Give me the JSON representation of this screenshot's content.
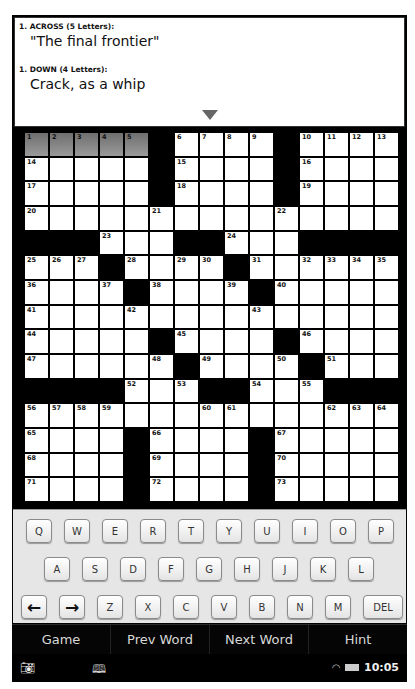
{
  "clues": {
    "across": {
      "heading": "1. ACROSS (5 Letters):",
      "text": "\"The final frontier\""
    },
    "down": {
      "heading": "1. DOWN (4 Letters):",
      "text": "Crack, as a whip"
    },
    "expand_icon": "triangle-down"
  },
  "grid": {
    "size": 15,
    "highlight_color": "#808080",
    "rows": [
      "....._...._....",
      "....._...._....",
      "....._...._....",
      "...............",
      "___...__...____",
      "..._...._......",
      "...._...._.....",
      "...............",
      "....._...._....",
      "......_...._...",
      "____...__...___",
      "...............",
      "...._...._.....",
      "...._...._.....",
      "...._...._....."
    ],
    "numbers": [
      [
        0,
        0,
        "1"
      ],
      [
        0,
        1,
        "2"
      ],
      [
        0,
        2,
        "3"
      ],
      [
        0,
        3,
        "4"
      ],
      [
        0,
        4,
        "5"
      ],
      [
        0,
        6,
        "6"
      ],
      [
        0,
        7,
        "7"
      ],
      [
        0,
        8,
        "8"
      ],
      [
        0,
        9,
        "9"
      ],
      [
        0,
        11,
        "10"
      ],
      [
        0,
        12,
        "11"
      ],
      [
        0,
        13,
        "12"
      ],
      [
        0,
        14,
        "13"
      ],
      [
        1,
        0,
        "14"
      ],
      [
        1,
        6,
        "15"
      ],
      [
        1,
        11,
        "16"
      ],
      [
        2,
        0,
        "17"
      ],
      [
        2,
        6,
        "18"
      ],
      [
        2,
        11,
        "19"
      ],
      [
        3,
        0,
        "20"
      ],
      [
        3,
        5,
        "21"
      ],
      [
        3,
        10,
        "22"
      ],
      [
        4,
        3,
        "23"
      ],
      [
        4,
        8,
        "24"
      ],
      [
        5,
        0,
        "25"
      ],
      [
        5,
        1,
        "26"
      ],
      [
        5,
        2,
        "27"
      ],
      [
        5,
        4,
        "28"
      ],
      [
        5,
        6,
        "29"
      ],
      [
        5,
        7,
        "30"
      ],
      [
        5,
        9,
        "31"
      ],
      [
        5,
        11,
        "32"
      ],
      [
        5,
        12,
        "33"
      ],
      [
        5,
        13,
        "34"
      ],
      [
        5,
        14,
        "35"
      ],
      [
        6,
        0,
        "36"
      ],
      [
        6,
        3,
        "37"
      ],
      [
        6,
        5,
        "38"
      ],
      [
        6,
        8,
        "39"
      ],
      [
        6,
        10,
        "40"
      ],
      [
        7,
        0,
        "41"
      ],
      [
        7,
        4,
        "42"
      ],
      [
        7,
        9,
        "43"
      ],
      [
        8,
        0,
        "44"
      ],
      [
        8,
        6,
        "45"
      ],
      [
        8,
        11,
        "46"
      ],
      [
        9,
        0,
        "47"
      ],
      [
        9,
        5,
        "48"
      ],
      [
        9,
        7,
        "49"
      ],
      [
        9,
        10,
        "50"
      ],
      [
        9,
        12,
        "51"
      ],
      [
        10,
        4,
        "52"
      ],
      [
        10,
        6,
        "53"
      ],
      [
        10,
        9,
        "54"
      ],
      [
        10,
        11,
        "55"
      ],
      [
        11,
        0,
        "56"
      ],
      [
        11,
        1,
        "57"
      ],
      [
        11,
        2,
        "58"
      ],
      [
        11,
        3,
        "59"
      ],
      [
        11,
        7,
        "60"
      ],
      [
        11,
        8,
        "61"
      ],
      [
        11,
        12,
        "62"
      ],
      [
        11,
        13,
        "63"
      ],
      [
        11,
        14,
        "64"
      ],
      [
        12,
        0,
        "65"
      ],
      [
        12,
        5,
        "66"
      ],
      [
        12,
        10,
        "67"
      ],
      [
        13,
        0,
        "68"
      ],
      [
        13,
        5,
        "69"
      ],
      [
        13,
        10,
        "70"
      ],
      [
        14,
        0,
        "71"
      ],
      [
        14,
        5,
        "72"
      ],
      [
        14,
        10,
        "73"
      ]
    ],
    "highlighted": [
      [
        0,
        0
      ],
      [
        0,
        1
      ],
      [
        0,
        2
      ],
      [
        0,
        3
      ],
      [
        0,
        4
      ]
    ]
  },
  "keyboard": {
    "row1": [
      "Q",
      "W",
      "E",
      "R",
      "T",
      "Y",
      "U",
      "I",
      "O",
      "P"
    ],
    "row2": [
      "A",
      "S",
      "D",
      "F",
      "G",
      "H",
      "J",
      "K",
      "L"
    ],
    "row3": [
      "←",
      "→",
      "Z",
      "X",
      "C",
      "V",
      "B",
      "N",
      "M",
      "DEL"
    ]
  },
  "menu": {
    "items": [
      "Game",
      "Prev Word",
      "Next Word",
      "Hint"
    ]
  },
  "status_bar": {
    "left_icon": "camera-icon",
    "book_icon": "book-icon",
    "wifi_icon": "wifi-icon",
    "battery_icon": "battery-icon",
    "time": "10:05"
  }
}
